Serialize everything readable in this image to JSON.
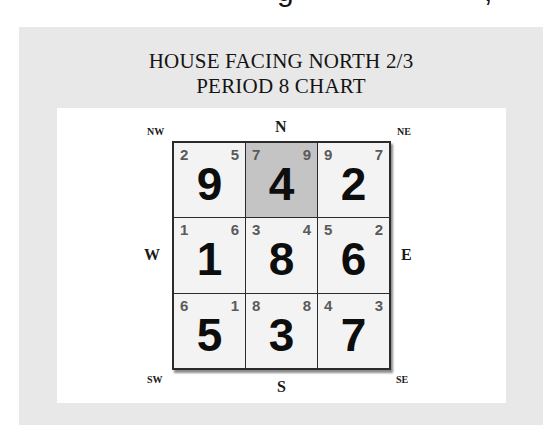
{
  "cropped_header": {
    "glyph_1": "g",
    "glyph_2": ","
  },
  "chart": {
    "title_line_1": "HOUSE FACING NORTH 2/3",
    "title_line_2": "PERIOD 8 CHART",
    "compass": {
      "nw": "NW",
      "n": "N",
      "ne": "NE",
      "w": "W",
      "e": "E",
      "sw": "SW",
      "s": "S",
      "se": "SE"
    },
    "highlight_color": "#c4c4c4",
    "cells": [
      {
        "position": "NW",
        "mountain": "2",
        "water": "5",
        "base": "9",
        "highlighted": false
      },
      {
        "position": "N",
        "mountain": "7",
        "water": "9",
        "base": "4",
        "highlighted": true
      },
      {
        "position": "NE",
        "mountain": "9",
        "water": "7",
        "base": "2",
        "highlighted": false
      },
      {
        "position": "W",
        "mountain": "1",
        "water": "6",
        "base": "1",
        "highlighted": false
      },
      {
        "position": "C",
        "mountain": "3",
        "water": "4",
        "base": "8",
        "highlighted": false
      },
      {
        "position": "E",
        "mountain": "5",
        "water": "2",
        "base": "6",
        "highlighted": false
      },
      {
        "position": "SW",
        "mountain": "6",
        "water": "1",
        "base": "5",
        "highlighted": false
      },
      {
        "position": "S",
        "mountain": "8",
        "water": "8",
        "base": "3",
        "highlighted": false
      },
      {
        "position": "SE",
        "mountain": "4",
        "water": "3",
        "base": "7",
        "highlighted": false
      }
    ]
  }
}
